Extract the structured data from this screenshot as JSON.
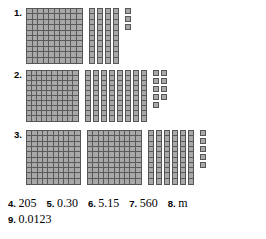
{
  "page": {
    "background_color": "#ffffff",
    "block_fill_color": "#a8a8a8",
    "block_line_color": "#555555"
  },
  "problems": [
    {
      "label": "1.",
      "hundreds": 1,
      "tens": 4,
      "ones": 3,
      "value": 143
    },
    {
      "label": "2.",
      "hundreds": 1,
      "tens": 8,
      "ones": 9,
      "value": 189
    },
    {
      "label": "3.",
      "hundreds": 2,
      "tens": 6,
      "ones": 5,
      "value": 265
    }
  ],
  "answers": [
    [
      {
        "num": "4.",
        "value": "205"
      },
      {
        "num": "5.",
        "value": "0.30"
      },
      {
        "num": "6.",
        "value": "5.15"
      },
      {
        "num": "7.",
        "value": "560"
      },
      {
        "num": "8.",
        "value": "m"
      }
    ],
    [
      {
        "num": "9.",
        "value": "0.0123"
      }
    ]
  ]
}
